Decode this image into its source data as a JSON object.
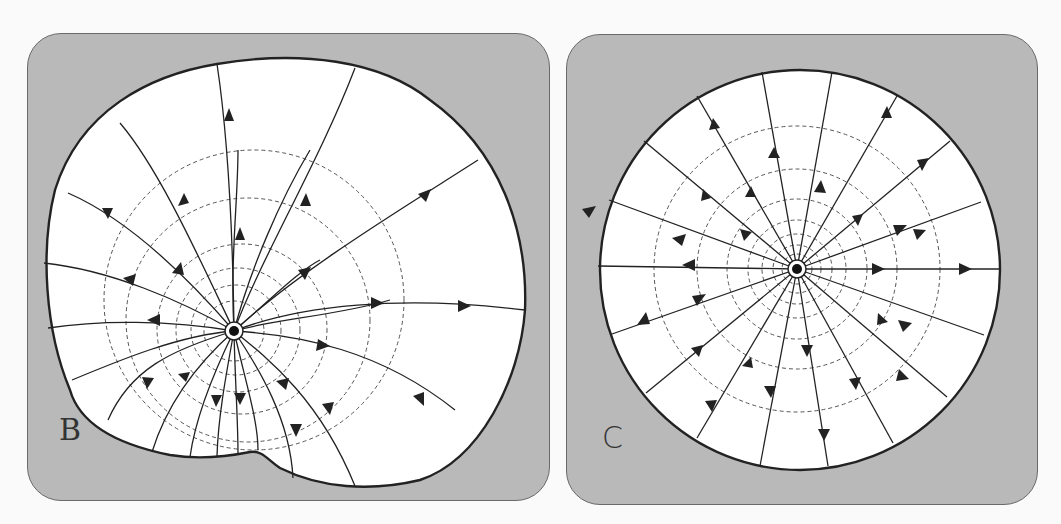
{
  "figure": {
    "panels": [
      {
        "id": "B",
        "label": "B",
        "description": "Field lines radiating from a point source inside a non-circular (notched) boundary; dashed equipotential circles centered at source",
        "source": {
          "x": 234,
          "y": 331
        },
        "dashed_circle_radii": [
          30,
          45,
          60,
          78,
          108,
          150
        ]
      },
      {
        "id": "C",
        "label": "C",
        "description": "Field lines radiating symmetrically from a point source at the center of a circular boundary; dashed equipotential circles",
        "source": {
          "x": 797,
          "y": 269
        },
        "boundary_radius": 200,
        "dashed_circle_radii": [
          15,
          27,
          40,
          55,
          72,
          100,
          143
        ],
        "field_line_count": 18
      }
    ],
    "colors": {
      "panel_bg": "#b9b9b9",
      "region_fill": "#ffffff",
      "line": "#222222",
      "dashed": "#555555"
    }
  }
}
